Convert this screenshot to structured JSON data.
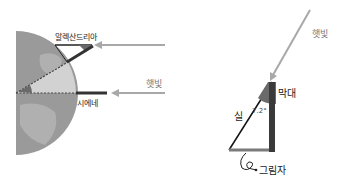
{
  "diagram": {
    "left": {
      "city_top": "알렉산드리아",
      "city_bottom": "시에네",
      "sunlight": "햇빛"
    },
    "right": {
      "sunlight": "햇빛",
      "stick": "막대",
      "string": "실",
      "angle": "7.2°",
      "shadow": "그림자"
    },
    "colors": {
      "globe": "#9a9a9a",
      "globe_land": "#b5b5b5",
      "globe_lit": "#d6d6d6",
      "sun_arrow": "#a8a8a8",
      "stick": "#3a3a3a",
      "shadow_fill": "#7a7a7a",
      "angle_wedge": "#6a6a6a"
    }
  }
}
